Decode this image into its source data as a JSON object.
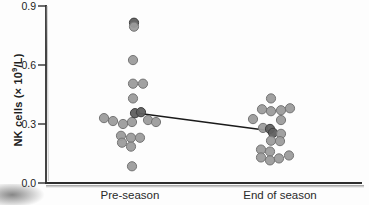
{
  "figure": {
    "ylabel": {
      "pre": "NK cells (× 10",
      "sup": "9",
      "post": "/L)"
    }
  },
  "chart_data": {
    "type": "scatter",
    "title": "",
    "xlabel": "",
    "ylabel": "NK cells (× 10^9/L)",
    "categories": [
      "Pre-season",
      "End of season"
    ],
    "ylim": [
      0.0,
      0.9
    ],
    "yticks": [
      0.0,
      0.3,
      0.6,
      0.9
    ],
    "grid": false,
    "legend": "none",
    "point_color": "#9c9c9c",
    "point_edge_color": "#757575",
    "dark_point_color": "#5f5f5f",
    "dark_point_edge_color": "#3e3e3e",
    "axis_color": "#2f2f2f",
    "line_color": "#1a1a1a",
    "series": [
      {
        "name": "Pre-season",
        "points": [
          {
            "dx": 4,
            "v": 0.815,
            "dark": true
          },
          {
            "dx": 4,
            "v": 0.795
          },
          {
            "dx": 3,
            "v": 0.625
          },
          {
            "dx": 3,
            "v": 0.505
          },
          {
            "dx": 13,
            "v": 0.505
          },
          {
            "dx": 3,
            "v": 0.43
          },
          {
            "dx": -26,
            "v": 0.33
          },
          {
            "dx": -17,
            "v": 0.315
          },
          {
            "dx": -7,
            "v": 0.3
          },
          {
            "dx": 2,
            "v": 0.31
          },
          {
            "dx": 5,
            "v": 0.355,
            "dark": true
          },
          {
            "dx": 11,
            "v": 0.36,
            "dark": true
          },
          {
            "dx": 18,
            "v": 0.32
          },
          {
            "dx": 26,
            "v": 0.31
          },
          {
            "dx": -9,
            "v": 0.24
          },
          {
            "dx": 1,
            "v": 0.23
          },
          {
            "dx": 10,
            "v": 0.23
          },
          {
            "dx": -8,
            "v": 0.205
          },
          {
            "dx": 1,
            "v": 0.185
          },
          {
            "dx": 2,
            "v": 0.085
          }
        ]
      },
      {
        "name": "End of season",
        "points": [
          {
            "dx": -9,
            "v": 0.43
          },
          {
            "dx": -18,
            "v": 0.375
          },
          {
            "dx": -9,
            "v": 0.365
          },
          {
            "dx": 1,
            "v": 0.37
          },
          {
            "dx": 10,
            "v": 0.38
          },
          {
            "dx": -27,
            "v": 0.325
          },
          {
            "dx": 1,
            "v": 0.32
          },
          {
            "dx": -17,
            "v": 0.28
          },
          {
            "dx": -10,
            "v": 0.275,
            "dark": true
          },
          {
            "dx": -7,
            "v": 0.255,
            "dark": true
          },
          {
            "dx": 1,
            "v": 0.25
          },
          {
            "dx": -9,
            "v": 0.215
          },
          {
            "dx": 0,
            "v": 0.213
          },
          {
            "dx": -19,
            "v": 0.17
          },
          {
            "dx": -10,
            "v": 0.16
          },
          {
            "dx": -19,
            "v": 0.13
          },
          {
            "dx": -10,
            "v": 0.115
          },
          {
            "dx": -1,
            "v": 0.125
          },
          {
            "dx": 9,
            "v": 0.14
          }
        ]
      }
    ],
    "mean_line": {
      "from": {
        "category_index": 0,
        "dx": 6,
        "value": 0.356
      },
      "to": {
        "category_index": 1,
        "dx": -8,
        "value": 0.264
      }
    }
  }
}
